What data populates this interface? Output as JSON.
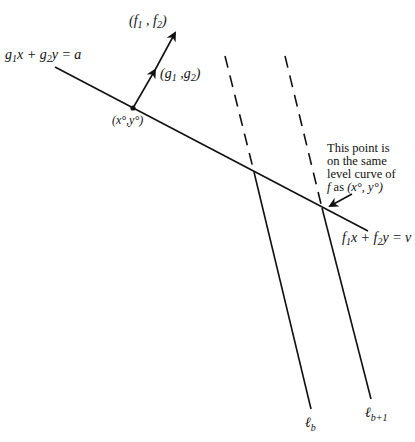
{
  "diagram": {
    "budget_line_label": {
      "g": "g",
      "sub1": "1",
      "mid1": "x + ",
      "sub2": "2",
      "tail": "y = a"
    },
    "iso_line_label": {
      "f": "f",
      "sub1": "1",
      "mid1": "x + ",
      "sub2": "2",
      "tail": "y = v"
    },
    "point_label": "(x°,y°)",
    "gradient_g_label": {
      "open": "(g",
      "sub1": "1",
      "mid": " ,g",
      "sub2": "2",
      "close": ")"
    },
    "gradient_f_label": {
      "open": "(f",
      "sub1": "1",
      "mid": " , f",
      "sub2": "2",
      "close": ")"
    },
    "annotation_lines": [
      "This point is",
      "on the same",
      "level curve of",
      "f as (x°, y°)"
    ],
    "annotation_line4": {
      "f": "f",
      "as": " as ",
      "pt": "(x°, y°)"
    },
    "line_b_label": {
      "l": "ℓ",
      "sub": "b"
    },
    "line_b1_label": {
      "l": "ℓ",
      "sub": "b+1"
    }
  }
}
